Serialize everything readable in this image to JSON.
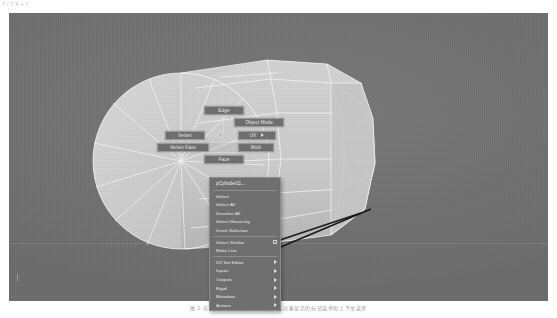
{
  "corner_text": "7 / 7 4 + 7",
  "viewport": {
    "background_color": "#717171",
    "mesh_color": "#c9c9c9",
    "wireframe_color": "#ffffff",
    "object_name": "pCylinder11"
  },
  "marking_menu": {
    "items": [
      {
        "label": "Edge",
        "position": "north"
      },
      {
        "label": "Object Mode",
        "position": "northeast"
      },
      {
        "label": "Vertex",
        "position": "west"
      },
      {
        "label": "UV",
        "position": "east",
        "has_submenu": true
      },
      {
        "label": "Vertex Face",
        "position": "southwest"
      },
      {
        "label": "Multi",
        "position": "southeast"
      },
      {
        "label": "Face",
        "position": "south"
      }
    ]
  },
  "context_menu": {
    "title": "pCylinder11...",
    "groups": [
      {
        "items": [
          {
            "label": "Select"
          },
          {
            "label": "Select All"
          },
          {
            "label": "Deselect All"
          },
          {
            "label": "Select Hierarchy"
          },
          {
            "label": "Invert Selection"
          }
        ]
      },
      {
        "items": [
          {
            "label": "Select Similar",
            "checkbox": true
          },
          {
            "label": "Make Live"
          }
        ]
      },
      {
        "items": [
          {
            "label": "UV Set Editor",
            "submenu": true
          },
          {
            "label": "Inputs",
            "submenu": true
          },
          {
            "label": "Outputs",
            "submenu": true
          },
          {
            "label": "Rigid",
            "submenu": true
          },
          {
            "label": "Metadata",
            "submenu": true
          },
          {
            "label": "Actions",
            "submenu": true
          }
        ]
      }
    ]
  },
  "caption": "图 1 在 Maya 视口中右键单击多边形对象显示的标记菜单和上下文菜单"
}
